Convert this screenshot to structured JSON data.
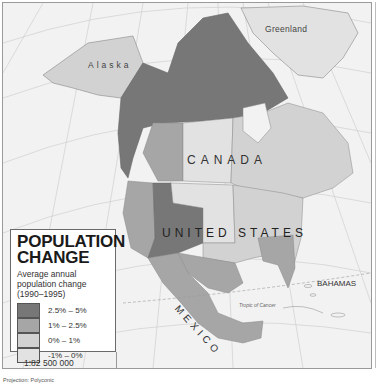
{
  "map": {
    "title": "POPULATION CHANGE",
    "title_lines": [
      "POPULATION",
      "CHANGE"
    ],
    "subtitle": "Average annual population change (1990–1995)",
    "subtitle_lines": [
      "Average annual",
      "population change",
      "(1990–1995)"
    ],
    "labels": {
      "greenland": "Greenland",
      "alaska": "Alaska",
      "canada": "CANADA",
      "united_states": "UNITED STATES",
      "mexico": "MEXICO",
      "bahamas": "BAHAMAS",
      "tropic": "Tropic of Cancer"
    },
    "legend": [
      {
        "range": "2.5% – 5%",
        "color": "#777777"
      },
      {
        "range": "1% – 2.5%",
        "color": "#a6a6a6"
      },
      {
        "range": "0% – 1%",
        "color": "#d2d2d2"
      },
      {
        "range": "-1% – 0%",
        "color": "#e2e2e2"
      }
    ],
    "scale": "1:82 500 000",
    "projection": "Projection: Polyconic",
    "colors": {
      "ocean": "#f2f2f2",
      "class_high": "#777777",
      "class_mid": "#a6a6a6",
      "class_low": "#d2d2d2",
      "class_neg": "#e2e2e2",
      "no_data": "#dedede"
    }
  }
}
